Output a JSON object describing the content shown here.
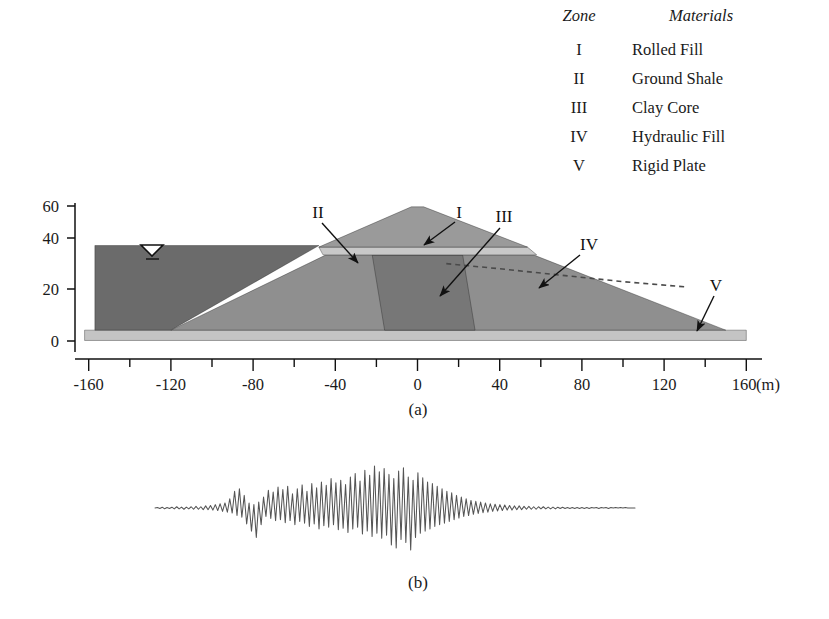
{
  "figure": {
    "panels": [
      {
        "id": "a",
        "caption": "(a)",
        "description": "Dam cross-section"
      },
      {
        "id": "b",
        "caption": "(b)",
        "description": "Input seismic acceleration time history"
      }
    ]
  },
  "legend": {
    "headers": {
      "zone": "Zone",
      "materials": "Materials"
    },
    "rows": [
      {
        "zone": "I",
        "material": "Rolled Fill"
      },
      {
        "zone": "II",
        "material": "Ground Shale"
      },
      {
        "zone": "III",
        "material": "Clay Core"
      },
      {
        "zone": "IV",
        "material": "Hydraulic Fill"
      },
      {
        "zone": "V",
        "material": "Rigid Plate"
      }
    ]
  },
  "cross_section": {
    "zone_labels": [
      {
        "name": "I",
        "text": "I"
      },
      {
        "name": "II",
        "text": "II"
      },
      {
        "name": "III",
        "text": "III"
      },
      {
        "name": "IV",
        "text": "IV"
      },
      {
        "name": "V",
        "text": "V"
      }
    ],
    "water_symbol": "water-table-triangle"
  },
  "chart_data": {
    "type": "line",
    "title": "",
    "xlabel": "(m)",
    "ylabel": "",
    "xlim": [
      -170,
      168
    ],
    "ylim": [
      0,
      66
    ],
    "xticks": [
      -160,
      -140,
      -120,
      -100,
      -80,
      -60,
      -40,
      -20,
      0,
      20,
      40,
      60,
      80,
      100,
      120,
      140,
      160
    ],
    "xticklabels": [
      "-160",
      "",
      "-120",
      "",
      "-80",
      "",
      "-40",
      "",
      "0",
      "",
      "40",
      "",
      "80",
      "",
      "120",
      "",
      "160"
    ],
    "x_axis_unit": "(m)",
    "yticks": [
      0,
      20,
      40,
      60
    ],
    "yticklabels": [
      "0",
      "20",
      "40",
      "60"
    ],
    "grid": false,
    "legend_position": "top-right",
    "series": [
      {
        "name": "Zone I - Rolled Fill",
        "color": "#9a9a9a",
        "polygon": [
          [
            -48,
            36
          ],
          [
            0,
            52
          ],
          [
            52,
            36
          ]
        ]
      },
      {
        "name": "Zone II - Ground Shale",
        "color": "#c8c8c8",
        "polygon": [
          [
            -48,
            36
          ],
          [
            52,
            36
          ],
          [
            57,
            33
          ],
          [
            -45,
            33
          ]
        ]
      },
      {
        "name": "Zone III - Clay Core",
        "color": "#777777",
        "polygon": [
          [
            -22,
            33
          ],
          [
            22,
            33
          ],
          [
            28,
            4
          ],
          [
            -16,
            4
          ]
        ]
      },
      {
        "name": "Zone IV - Hydraulic Fill",
        "color": "#8f8f8f",
        "polygon": [
          [
            -45,
            33
          ],
          [
            57,
            33
          ],
          [
            150,
            4
          ],
          [
            -120,
            4
          ]
        ]
      },
      {
        "name": "Zone V - Rigid Plate",
        "color": "#c4c4c4",
        "polygon": [
          [
            -162,
            4
          ],
          [
            160,
            4
          ],
          [
            160,
            0
          ],
          [
            -162,
            0
          ]
        ]
      },
      {
        "name": "Reservoir water body",
        "color": "#6b6b6b",
        "polygon": [
          [
            -157,
            37
          ],
          [
            -48,
            37
          ],
          [
            -120,
            4
          ],
          [
            -157,
            4
          ]
        ]
      },
      {
        "name": "Phreatic line",
        "style": "dashed",
        "points": [
          [
            20,
            29
          ],
          [
            60,
            26
          ],
          [
            100,
            23
          ],
          [
            132,
            21
          ]
        ]
      }
    ]
  },
  "accelerogram": {
    "type": "line",
    "title": "",
    "baseline": 0,
    "amplitude_note": "normalized acceleration time history",
    "values": [
      0.0,
      0.01,
      -0.01,
      0.02,
      -0.02,
      0.01,
      -0.01,
      0.02,
      -0.02,
      0.03,
      -0.02,
      0.02,
      -0.03,
      0.02,
      -0.02,
      0.03,
      -0.03,
      0.04,
      -0.03,
      0.03,
      -0.04,
      0.05,
      -0.04,
      0.06,
      -0.05,
      0.08,
      -0.06,
      0.1,
      -0.08,
      0.12,
      -0.1,
      0.22,
      -0.12,
      0.4,
      -0.18,
      0.46,
      -0.22,
      0.3,
      -0.38,
      0.12,
      -0.55,
      0.08,
      -0.7,
      0.14,
      -0.4,
      0.26,
      -0.2,
      0.42,
      -0.25,
      0.38,
      -0.3,
      0.5,
      -0.28,
      0.44,
      -0.35,
      0.52,
      -0.3,
      0.34,
      -0.4,
      0.46,
      -0.32,
      0.55,
      -0.36,
      0.4,
      -0.44,
      0.58,
      -0.38,
      0.48,
      -0.5,
      0.62,
      -0.42,
      0.54,
      -0.46,
      0.7,
      -0.4,
      0.6,
      -0.52,
      0.66,
      -0.48,
      0.56,
      -0.58,
      0.74,
      -0.5,
      0.82,
      -0.46,
      0.64,
      -0.62,
      0.9,
      -0.55,
      0.78,
      -0.68,
      1.0,
      -0.6,
      0.86,
      -0.72,
      0.94,
      -0.65,
      0.8,
      -0.88,
      0.7,
      -0.95,
      0.88,
      -0.75,
      0.96,
      -0.82,
      0.74,
      -1.0,
      0.66,
      -0.7,
      0.84,
      -0.6,
      0.72,
      -0.55,
      0.62,
      -0.5,
      0.58,
      -0.44,
      0.52,
      -0.4,
      0.46,
      -0.36,
      0.4,
      -0.32,
      0.36,
      -0.28,
      0.3,
      -0.24,
      0.26,
      -0.2,
      0.22,
      -0.18,
      0.18,
      -0.15,
      0.16,
      -0.13,
      0.14,
      -0.11,
      0.12,
      -0.1,
      0.1,
      -0.08,
      0.09,
      -0.07,
      0.08,
      -0.06,
      0.07,
      -0.05,
      0.06,
      -0.05,
      0.05,
      -0.04,
      0.05,
      -0.04,
      0.04,
      -0.03,
      0.04,
      -0.03,
      0.03,
      -0.03,
      0.03,
      -0.02,
      0.03,
      -0.02,
      0.02,
      -0.02,
      0.02,
      -0.02,
      0.02,
      -0.01,
      0.02,
      -0.01,
      0.01,
      -0.01,
      0.01,
      -0.01,
      0.01,
      -0.01,
      0.01,
      -0.01,
      0.01,
      -0.01,
      0.01,
      0.0,
      0.01,
      -0.01,
      0.01,
      0.0,
      0.01,
      -0.01,
      0.01,
      0.0,
      0.01,
      0.0,
      0.01,
      0.0,
      0.01,
      0.0,
      0.0,
      0.0,
      0.0
    ]
  },
  "colors": {
    "rolled_fill": "#9a9a9a",
    "ground_shale": "#c8c8c8",
    "clay_core": "#777777",
    "hydraulic_fill": "#8f8f8f",
    "rigid_plate": "#c4c4c4",
    "water": "#6b6b6b",
    "outline": "#222222",
    "text": "#1a1a1a"
  }
}
